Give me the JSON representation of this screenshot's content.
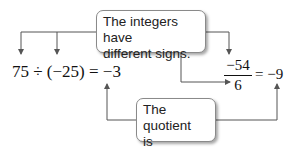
{
  "callouts": {
    "top": {
      "line1": "The integers have",
      "line2": "different signs."
    },
    "bottom": {
      "line1": "The quotient",
      "line2": "is negative."
    }
  },
  "equations": {
    "left": {
      "expression": "75 ÷ (−25) = −3"
    },
    "right": {
      "numerator": "−54",
      "denominator": "6",
      "equals": "= −9"
    }
  },
  "colors": {
    "line": "#555555",
    "box_border": "#8a8a8a"
  }
}
